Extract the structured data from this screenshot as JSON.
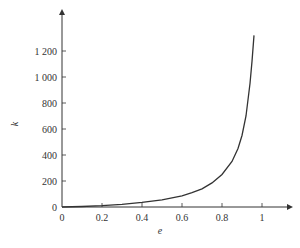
{
  "chart_data": {
    "type": "line",
    "title": "",
    "xlabel": "e",
    "ylabel": "k",
    "xlim": [
      0,
      1.15
    ],
    "ylim": [
      0,
      1400
    ],
    "grid": false,
    "legend": null,
    "x_ticks": [
      "0",
      "0.2",
      "0.4",
      "0.6",
      "0.8",
      "1"
    ],
    "y_ticks": [
      "0",
      "200",
      "400",
      "600",
      "800",
      "1 000",
      "1 200"
    ],
    "series": [
      {
        "name": "k(e)",
        "x": [
          0,
          0.1,
          0.2,
          0.3,
          0.4,
          0.5,
          0.6,
          0.65,
          0.7,
          0.75,
          0.8,
          0.85,
          0.88,
          0.9,
          0.92,
          0.94,
          0.95,
          0.96
        ],
        "y": [
          0,
          4,
          10,
          20,
          35,
          55,
          85,
          110,
          140,
          185,
          250,
          350,
          450,
          550,
          700,
          950,
          1120,
          1320
        ]
      }
    ]
  }
}
